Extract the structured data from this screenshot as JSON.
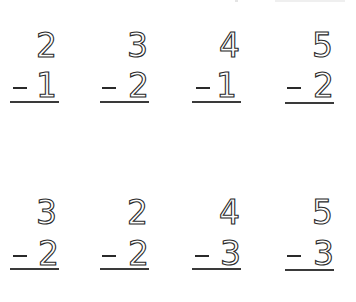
{
  "worksheet": {
    "operator": "-",
    "rows": [
      {
        "problems": [
          {
            "minuend": "2",
            "subtrahend": "1"
          },
          {
            "minuend": "3",
            "subtrahend": "2"
          },
          {
            "minuend": "4",
            "subtrahend": "1"
          },
          {
            "minuend": "5",
            "subtrahend": "2"
          }
        ]
      },
      {
        "problems": [
          {
            "minuend": "3",
            "subtrahend": "2"
          },
          {
            "minuend": "2",
            "subtrahend": "2"
          },
          {
            "minuend": "4",
            "subtrahend": "3"
          },
          {
            "minuend": "5",
            "subtrahend": "3"
          }
        ]
      }
    ]
  }
}
